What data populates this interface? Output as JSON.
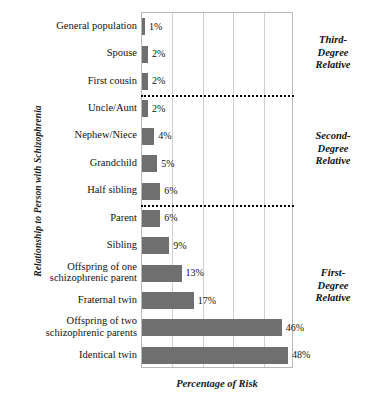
{
  "chart_data": {
    "type": "bar",
    "orientation": "horizontal",
    "title": "",
    "xlabel": "Percentage of Risk",
    "ylabel": "Relationship to Person with Schizophrenia",
    "xlim": [
      0,
      50
    ],
    "ylim": null,
    "grid": true,
    "gridline_values": [
      0,
      10,
      20,
      30,
      40,
      50
    ],
    "legend_position": "right",
    "categories": [
      "General population",
      "Spouse",
      "First cousin",
      "Uncle/Aunt",
      "Nephew/Niece",
      "Grandchild",
      "Half sibling",
      "Parent",
      "Sibling",
      "Offspring of one schizophrenic parent",
      "Fraternal twin",
      "Offspring of two schizophrenic parents",
      "Identical twin"
    ],
    "values": [
      1,
      2,
      2,
      2,
      4,
      5,
      6,
      6,
      9,
      13,
      17,
      46,
      48
    ],
    "value_labels": [
      "1%",
      "2%",
      "2%",
      "2%",
      "4%",
      "5%",
      "6%",
      "6%",
      "9%",
      "13%",
      "17%",
      "46%",
      "48%"
    ],
    "bar_color": "#6f6f6f",
    "groups": [
      {
        "label": "Third-\nDegree\nRelative",
        "label_lines": [
          "Third-",
          "Degree",
          "Relative"
        ],
        "categories": [
          "General population",
          "Spouse",
          "First cousin"
        ]
      },
      {
        "label": "Second-\nDegree\nRelative",
        "label_lines": [
          "Second-",
          "Degree",
          "Relative"
        ],
        "categories": [
          "Uncle/Aunt",
          "Nephew/Niece",
          "Grandchild",
          "Half sibling"
        ]
      },
      {
        "label": "First-\nDegree\nRelative",
        "label_lines": [
          "First-",
          "Degree",
          "Relative"
        ],
        "categories": [
          "Parent",
          "Sibling",
          "Offspring of one schizophrenic parent",
          "Fraternal twin",
          "Offspring of two schizophrenic parents",
          "Identical twin"
        ]
      }
    ],
    "group_separators_after": [
      "First cousin",
      "Half sibling"
    ]
  },
  "axis": {
    "y_title": "Relationship to Person with Schizophrenia",
    "x_title": "Percentage of Risk"
  },
  "category_label_lines": [
    [
      "General population"
    ],
    [
      "Spouse"
    ],
    [
      "First cousin"
    ],
    [
      "Uncle/Aunt"
    ],
    [
      "Nephew/Niece"
    ],
    [
      "Grandchild"
    ],
    [
      "Half sibling"
    ],
    [
      "Parent"
    ],
    [
      "Sibling"
    ],
    [
      "Offspring of one",
      "schizophrenic parent"
    ],
    [
      "Fraternal twin"
    ],
    [
      "Offspring of two",
      "schizophrenic parents"
    ],
    [
      "Identical twin"
    ]
  ],
  "groups_display": [
    {
      "lines": [
        "Third-",
        "Degree",
        "Relative"
      ]
    },
    {
      "lines": [
        "Second-",
        "Degree",
        "Relative"
      ]
    },
    {
      "lines": [
        "First-",
        "Degree",
        "Relative"
      ]
    }
  ],
  "colors": {
    "bar": "#6f6f6f",
    "grid": "#cfcfcf",
    "axis_border": "#b9b9b9",
    "separator": "#000000",
    "text": "#111111",
    "background": "#ffffff"
  }
}
